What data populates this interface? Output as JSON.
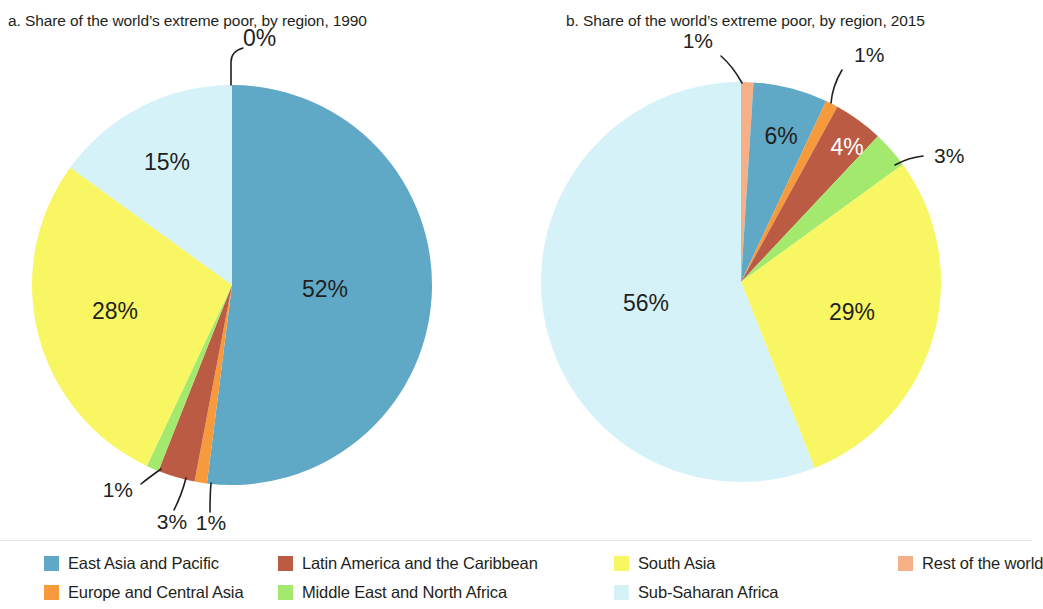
{
  "panels": {
    "a": {
      "title": "a. Share of the world’s extreme poor, by region, 1990"
    },
    "b": {
      "title": "b. Share of the world’s extreme poor, by region, 2015"
    }
  },
  "legend": {
    "items": [
      {
        "label": "East Asia and Pacific",
        "color": "#5FA9C6"
      },
      {
        "label": "Europe and Central Asia",
        "color": "#F79A3C"
      },
      {
        "label": "Latin America and the Caribbean",
        "color": "#BC5B44"
      },
      {
        "label": "Middle East and North Africa",
        "color": "#A2E96D"
      },
      {
        "label": "South Asia",
        "color": "#F8F763"
      },
      {
        "label": "Sub-Saharan Africa",
        "color": "#D6F2F9"
      },
      {
        "label": "Rest of the world",
        "color": "#F5B088"
      }
    ]
  },
  "chart_data": [
    {
      "type": "pie",
      "title": "a. Share of the world’s extreme poor, by region, 1990",
      "panel": "a",
      "year": "1990",
      "unit": "percent",
      "categories": [
        "Rest of the world",
        "East Asia and Pacific",
        "Europe and Central Asia",
        "Latin America and the Caribbean",
        "Middle East and North Africa",
        "South Asia",
        "Sub-Saharan Africa"
      ],
      "values": [
        0,
        52,
        1,
        3,
        1,
        28,
        15
      ],
      "labels": [
        "0%",
        "52%",
        "1%",
        "3%",
        "1%",
        "28%",
        "15%"
      ],
      "colors": [
        "#F5B088",
        "#5FA9C6",
        "#F79A3C",
        "#BC5B44",
        "#A2E96D",
        "#F8F763",
        "#D6F2F9"
      ],
      "start_angle_deg": 0,
      "direction": "clockwise",
      "legend_position": "bottom"
    },
    {
      "type": "pie",
      "title": "b. Share of the world’s extreme poor, by region, 2015",
      "panel": "b",
      "year": "2015",
      "unit": "percent",
      "categories": [
        "Rest of the world",
        "East Asia and Pacific",
        "Europe and Central Asia",
        "Latin America and the Caribbean",
        "Middle East and North Africa",
        "South Asia",
        "Sub-Saharan Africa"
      ],
      "values": [
        1,
        6,
        1,
        4,
        3,
        29,
        56
      ],
      "labels": [
        "1%",
        "6%",
        "1%",
        "4%",
        "3%",
        "29%",
        "56%"
      ],
      "colors": [
        "#F5B088",
        "#5FA9C6",
        "#F79A3C",
        "#BC5B44",
        "#A2E96D",
        "#F8F763",
        "#D6F2F9"
      ],
      "start_angle_deg": 0,
      "direction": "clockwise",
      "legend_position": "bottom"
    }
  ],
  "annotations": {
    "a": {
      "l0": "0%",
      "l52": "52%",
      "l1_ecs": "1%",
      "l3": "3%",
      "l1_mena": "1%",
      "l28": "28%",
      "l15": "15%"
    },
    "b": {
      "l1_rest": "1%",
      "l6": "6%",
      "l1_ecs": "1%",
      "l4": "4%",
      "l3": "3%",
      "l29": "29%",
      "l56": "56%"
    }
  }
}
